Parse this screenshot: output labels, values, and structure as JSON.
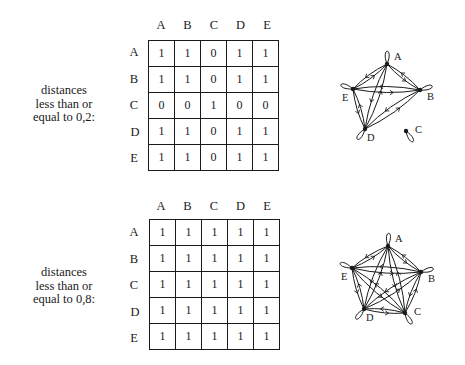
{
  "columns": [
    "A",
    "B",
    "C",
    "D",
    "E"
  ],
  "rows": [
    "A",
    "B",
    "C",
    "D",
    "E"
  ],
  "panels": [
    {
      "caption_lines": [
        "distances",
        "less than or",
        "equal to 0,2:"
      ],
      "threshold": "0,2",
      "matrix": [
        [
          "1",
          "1",
          "0",
          "1",
          "1"
        ],
        [
          "1",
          "1",
          "0",
          "1",
          "1"
        ],
        [
          "0",
          "0",
          "1",
          "0",
          "0"
        ],
        [
          "1",
          "1",
          "0",
          "1",
          "1"
        ],
        [
          "1",
          "1",
          "0",
          "1",
          "1"
        ]
      ],
      "graph": {
        "nodes": {
          "A": [
            387,
            64
          ],
          "B": [
            420,
            90
          ],
          "C": [
            406,
            131
          ],
          "D": [
            365,
            129
          ],
          "E": [
            353,
            89
          ]
        },
        "labels": {
          "A": "A",
          "B": "B",
          "C": "C",
          "D": "D",
          "E": "E"
        }
      }
    },
    {
      "caption_lines": [
        "distances",
        "less than or",
        "equal to 0,8:"
      ],
      "threshold": "0,8",
      "matrix": [
        [
          "1",
          "1",
          "1",
          "1",
          "1"
        ],
        [
          "1",
          "1",
          "1",
          "1",
          "1"
        ],
        [
          "1",
          "1",
          "1",
          "1",
          "1"
        ],
        [
          "1",
          "1",
          "1",
          "1",
          "1"
        ],
        [
          "1",
          "1",
          "1",
          "1",
          "1"
        ]
      ],
      "graph": {
        "nodes": {
          "A": [
            388,
            246
          ],
          "B": [
            421,
            272
          ],
          "C": [
            405,
            313
          ],
          "D": [
            364,
            309
          ],
          "E": [
            352,
            268
          ]
        },
        "labels": {
          "A": "A",
          "B": "B",
          "C": "C",
          "D": "D",
          "E": "E"
        }
      }
    }
  ]
}
